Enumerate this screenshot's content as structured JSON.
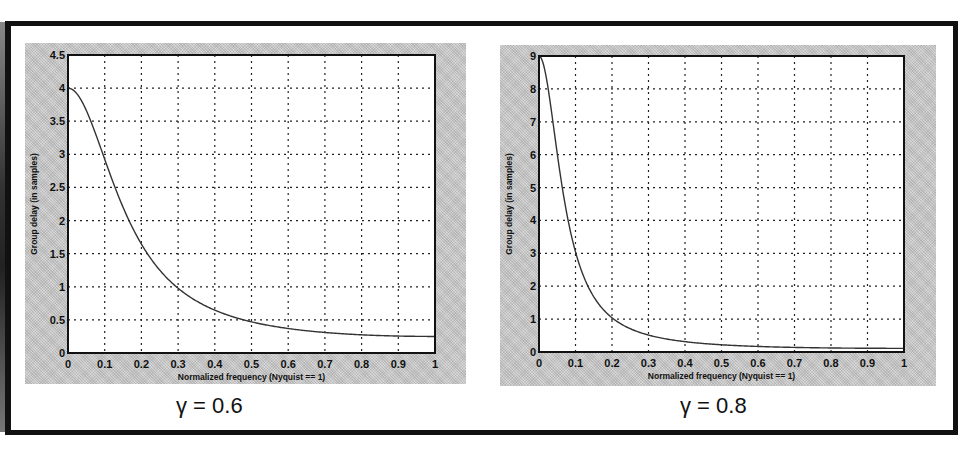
{
  "figure": {
    "left_caption": "γ = 0.6",
    "right_caption": "γ = 0.8"
  },
  "chart_data": [
    {
      "type": "line",
      "title": "",
      "caption": "γ = 0.6",
      "xlabel": "Normalized frequency (Nyquist == 1)",
      "ylabel": "Group delay (in samples)",
      "xlim": [
        0,
        1
      ],
      "ylim": [
        0,
        4.5
      ],
      "xticks": [
        "0",
        "0.1",
        "0.2",
        "0.3",
        "0.4",
        "0.5",
        "0.6",
        "0.7",
        "0.8",
        "0.9",
        "1"
      ],
      "yticks": [
        "0",
        "0.5",
        "1",
        "1.5",
        "2",
        "2.5",
        "3",
        "3.5",
        "4",
        "4.5"
      ],
      "grid": true,
      "grid_style": "dotted",
      "series": [
        {
          "name": "group delay",
          "x": [
            0,
            0.05,
            0.1,
            0.15,
            0.2,
            0.25,
            0.3,
            0.35,
            0.4,
            0.45,
            0.5,
            0.55,
            0.6,
            0.65,
            0.7,
            0.75,
            0.8,
            0.85,
            0.9,
            0.95,
            1.0
          ],
          "values": [
            4.0,
            3.62,
            2.86,
            2.12,
            1.58,
            1.21,
            0.96,
            0.78,
            0.65,
            0.55,
            0.47,
            0.42,
            0.37,
            0.34,
            0.31,
            0.29,
            0.27,
            0.26,
            0.255,
            0.252,
            0.25
          ]
        }
      ]
    },
    {
      "type": "line",
      "title": "",
      "caption": "γ = 0.8",
      "xlabel": "Normalized frequency (Nyquist == 1)",
      "ylabel": "Group delay (in samples)",
      "xlim": [
        0,
        1
      ],
      "ylim": [
        0,
        9
      ],
      "xticks": [
        "0",
        "0.1",
        "0.2",
        "0.3",
        "0.4",
        "0.5",
        "0.6",
        "0.7",
        "0.8",
        "0.9",
        "1"
      ],
      "yticks": [
        "0",
        "1",
        "2",
        "3",
        "4",
        "5",
        "6",
        "7",
        "8",
        "9"
      ],
      "grid": true,
      "grid_style": "dotted",
      "series": [
        {
          "name": "group delay",
          "x": [
            0,
            0.025,
            0.05,
            0.075,
            0.1,
            0.125,
            0.15,
            0.2,
            0.25,
            0.3,
            0.35,
            0.4,
            0.5,
            0.6,
            0.7,
            0.8,
            0.9,
            1.0
          ],
          "values": [
            9.0,
            8.2,
            6.43,
            4.6,
            3.28,
            2.4,
            1.82,
            1.11,
            0.76,
            0.56,
            0.43,
            0.35,
            0.22,
            0.17,
            0.14,
            0.12,
            0.115,
            0.111
          ]
        }
      ]
    }
  ]
}
